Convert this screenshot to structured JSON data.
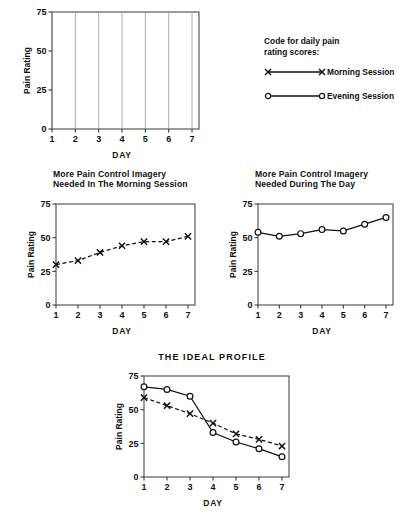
{
  "legend": {
    "heading": "Code for daily pain\nrating scores:",
    "entries": [
      {
        "label": "Morning Session",
        "marker": "cross-marker",
        "line": "dashed"
      },
      {
        "label": "Evening Session",
        "marker": "circle-marker",
        "line": "solid"
      }
    ]
  },
  "chart_data": [
    {
      "type": "line",
      "title": "",
      "panel": "blank-grid-chart",
      "xlabel": "DAY",
      "ylabel": "Pain Rating",
      "x": [
        1,
        2,
        3,
        4,
        5,
        6,
        7
      ],
      "xticklabels": [
        "1",
        "2",
        "3",
        "4",
        "5",
        "6",
        "7"
      ],
      "yticks": [
        0,
        25,
        50,
        75
      ],
      "yticklabels": [
        "0",
        "25",
        "50",
        "75"
      ],
      "ylim": [
        0,
        75
      ],
      "xlim": [
        1,
        7
      ],
      "grid": "vertical",
      "series": []
    },
    {
      "type": "line",
      "title": "More Pain Control Imagery\nNeeded In The Morning Session",
      "panel": "morning-session-chart",
      "xlabel": "DAY",
      "ylabel": "Pain Rating",
      "x": [
        1,
        2,
        3,
        4,
        5,
        6,
        7
      ],
      "xticklabels": [
        "1",
        "2",
        "3",
        "4",
        "5",
        "6",
        "7"
      ],
      "yticks": [
        0,
        25,
        50,
        75
      ],
      "yticklabels": [
        "0",
        "25",
        "50",
        "75"
      ],
      "ylim": [
        0,
        75
      ],
      "xlim": [
        1,
        7
      ],
      "grid": "none",
      "series": [
        {
          "name": "Morning Session",
          "marker": "cross-marker",
          "line": "dashed",
          "values": [
            30,
            33,
            39,
            44,
            47,
            47,
            51
          ]
        }
      ]
    },
    {
      "type": "line",
      "title": "More Pain Control Imagery\nNeeded During The Day",
      "panel": "during-the-day-chart",
      "xlabel": "DAY",
      "ylabel": "Pain Rating",
      "x": [
        1,
        2,
        3,
        4,
        5,
        6,
        7
      ],
      "xticklabels": [
        "1",
        "2",
        "3",
        "4",
        "5",
        "6",
        "7"
      ],
      "yticks": [
        0,
        25,
        50,
        75
      ],
      "yticklabels": [
        "0",
        "25",
        "50",
        "75"
      ],
      "ylim": [
        0,
        75
      ],
      "xlim": [
        1,
        7
      ],
      "grid": "none",
      "series": [
        {
          "name": "Evening Session",
          "marker": "circle-marker",
          "line": "solid",
          "values": [
            54,
            51,
            53,
            56,
            55,
            60,
            65
          ]
        }
      ]
    },
    {
      "type": "line",
      "title": "THE IDEAL PROFILE",
      "panel": "ideal-profile-chart",
      "xlabel": "DAY",
      "ylabel": "Pain Rating",
      "x": [
        1,
        2,
        3,
        4,
        5,
        6,
        7
      ],
      "xticklabels": [
        "1",
        "2",
        "3",
        "4",
        "5",
        "6",
        "7"
      ],
      "yticks": [
        0,
        25,
        50,
        75
      ],
      "yticklabels": [
        "0",
        "25",
        "50",
        "75"
      ],
      "ylim": [
        0,
        75
      ],
      "xlim": [
        1,
        7
      ],
      "grid": "none",
      "series": [
        {
          "name": "Evening Session",
          "marker": "circle-marker",
          "line": "solid",
          "values": [
            67,
            65,
            60,
            33,
            26,
            21,
            15
          ]
        },
        {
          "name": "Morning Session",
          "marker": "cross-marker",
          "line": "dashed",
          "values": [
            59,
            53,
            47,
            40,
            32,
            28,
            23
          ]
        }
      ]
    }
  ]
}
